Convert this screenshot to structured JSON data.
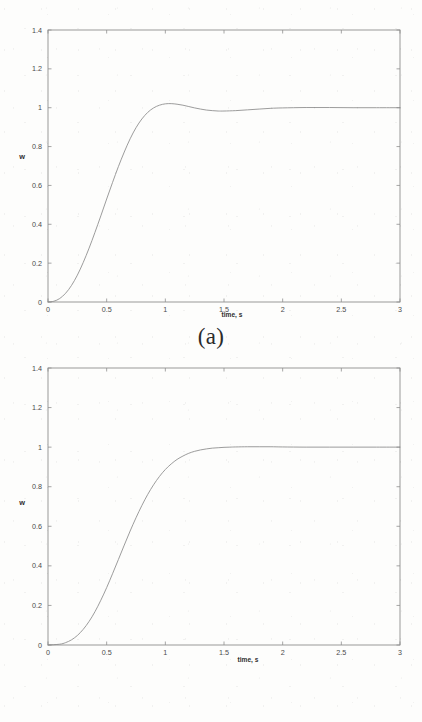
{
  "figures": [
    {
      "id": "a",
      "caption": "(a)",
      "xlabel": "time, s",
      "ylabel": "w",
      "xticks": [
        "0",
        "0.5",
        "1",
        "1.5",
        "2",
        "2.5",
        "3"
      ],
      "yticks": [
        "0",
        "0.2",
        "0.4",
        "0.6",
        "0.8",
        "1",
        "1.2",
        "1.4"
      ]
    },
    {
      "id": "b",
      "caption": "(b)",
      "xlabel": "time, s",
      "ylabel": "w",
      "xticks": [
        "0",
        "0.5",
        "1",
        "1.5",
        "2",
        "2.5",
        "3"
      ],
      "yticks": [
        "0",
        "0.2",
        "0.4",
        "0.6",
        "0.8",
        "1",
        "1.2",
        "1.4"
      ]
    }
  ],
  "chart_data": [
    {
      "type": "line",
      "id": "a",
      "title": "(a)",
      "xlabel": "time, s",
      "ylabel": "w",
      "xlim": [
        0,
        3
      ],
      "ylim": [
        0,
        1.4
      ],
      "xticks": [
        0,
        0.5,
        1,
        1.5,
        2,
        2.5,
        3
      ],
      "yticks": [
        0,
        0.2,
        0.4,
        0.6,
        0.8,
        1,
        1.2,
        1.4
      ],
      "grid": false,
      "legend": null,
      "series": [
        {
          "name": "w(t)",
          "color": "#8a8a8a",
          "x": [
            0,
            0.05,
            0.1,
            0.15,
            0.2,
            0.25,
            0.3,
            0.35,
            0.4,
            0.45,
            0.5,
            0.55,
            0.6,
            0.65,
            0.7,
            0.75,
            0.8,
            0.85,
            0.9,
            0.95,
            1.0,
            1.05,
            1.1,
            1.15,
            1.2,
            1.25,
            1.3,
            1.35,
            1.4,
            1.45,
            1.5,
            1.6,
            1.7,
            1.8,
            1.9,
            2.0,
            2.2,
            2.4,
            2.6,
            2.8,
            3.0
          ],
          "y": [
            0.0,
            0.004,
            0.018,
            0.045,
            0.085,
            0.138,
            0.203,
            0.277,
            0.358,
            0.443,
            0.53,
            0.615,
            0.697,
            0.772,
            0.84,
            0.897,
            0.942,
            0.976,
            0.999,
            1.013,
            1.02,
            1.021,
            1.018,
            1.013,
            1.006,
            0.999,
            0.993,
            0.988,
            0.985,
            0.983,
            0.983,
            0.985,
            0.989,
            0.993,
            0.997,
            0.999,
            1.001,
            1.001,
            1.0,
            1.0,
            1.0
          ]
        }
      ],
      "annotations": [
        "overshoot peak ≈ 1.02 at t ≈ 0.8 s",
        "settles to 1 after t ≈ 2 s"
      ]
    },
    {
      "type": "line",
      "id": "b",
      "title": "(b)",
      "xlabel": "time, s",
      "ylabel": "w",
      "xlim": [
        0,
        3
      ],
      "ylim": [
        0,
        1.4
      ],
      "xticks": [
        0,
        0.5,
        1,
        1.5,
        2,
        2.5,
        3
      ],
      "yticks": [
        0,
        0.2,
        0.4,
        0.6,
        0.8,
        1,
        1.2,
        1.4
      ],
      "grid": false,
      "legend": null,
      "series": [
        {
          "name": "w(t)",
          "color": "#8a8a8a",
          "x": [
            0,
            0.1,
            0.15,
            0.2,
            0.25,
            0.3,
            0.35,
            0.4,
            0.45,
            0.5,
            0.55,
            0.6,
            0.65,
            0.7,
            0.75,
            0.8,
            0.85,
            0.9,
            0.95,
            1.0,
            1.05,
            1.1,
            1.15,
            1.2,
            1.25,
            1.3,
            1.35,
            1.4,
            1.45,
            1.5,
            1.55,
            1.6,
            1.7,
            1.8,
            1.9,
            2.0,
            2.2,
            2.4,
            2.6,
            2.8,
            3.0
          ],
          "y": [
            0.0,
            0.004,
            0.012,
            0.026,
            0.048,
            0.079,
            0.119,
            0.168,
            0.226,
            0.29,
            0.36,
            0.432,
            0.505,
            0.576,
            0.643,
            0.705,
            0.761,
            0.81,
            0.852,
            0.887,
            0.915,
            0.938,
            0.955,
            0.969,
            0.979,
            0.986,
            0.991,
            0.995,
            0.997,
            0.999,
            1.0,
            1.001,
            1.002,
            1.002,
            1.002,
            1.001,
            1.0,
            1.0,
            1.0,
            1.0,
            1.0
          ]
        }
      ],
      "annotations": [
        "monotonic rise, no overshoot",
        "reaches 1 at t ≈ 1.6 s"
      ]
    }
  ],
  "colors": {
    "curve": "#8a8a8a",
    "axis": "#8f8f8f",
    "text": "#3a3a3a",
    "background": "#fdfdfc"
  }
}
